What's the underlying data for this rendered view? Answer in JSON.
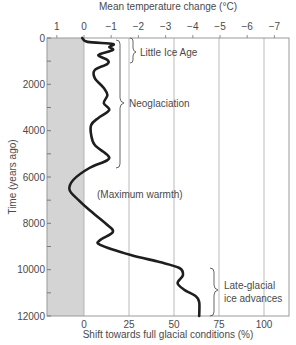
{
  "chart_data": {
    "type": "line",
    "title": "",
    "top_axis": {
      "label": "Mean temperature change (°C)",
      "ticks": [
        "1",
        "0",
        "−1",
        "−2",
        "−3",
        "−4",
        "−5",
        "−6",
        "−7"
      ],
      "tick_values": [
        1,
        0,
        -1,
        -2,
        -3,
        -4,
        -5,
        -6,
        -7
      ]
    },
    "xlabel": "Shift towards full glacial conditions (%)",
    "ylabel": "Time (years ago)",
    "x_ticks": [
      "0",
      "25",
      "50",
      "75",
      "100"
    ],
    "x_tick_values": [
      0,
      25,
      50,
      75,
      100
    ],
    "y_ticks": [
      "0",
      "2000",
      "4000",
      "6000",
      "8000",
      "10000",
      "12000"
    ],
    "y_tick_values": [
      0,
      2000,
      4000,
      6000,
      8000,
      10000,
      12000
    ],
    "xlim": [
      -20,
      113
    ],
    "ylim": [
      0,
      12000
    ],
    "y_inverted": true,
    "shaded_region": {
      "x_from": -20,
      "x_to": 0,
      "color": "#d4d4d4"
    },
    "grid": {
      "vertical_at": [
        0,
        25,
        50,
        75,
        100
      ],
      "horizontal": false
    },
    "series": [
      {
        "name": "Glacial conditions shift",
        "points": [
          {
            "time": 0,
            "pct": -1
          },
          {
            "time": 170,
            "pct": 2
          },
          {
            "time": 260,
            "pct": 16
          },
          {
            "time": 390,
            "pct": 14
          },
          {
            "time": 520,
            "pct": 16
          },
          {
            "time": 730,
            "pct": 8
          },
          {
            "time": 950,
            "pct": 13
          },
          {
            "time": 1120,
            "pct": 13
          },
          {
            "time": 1380,
            "pct": 6
          },
          {
            "time": 1730,
            "pct": 6
          },
          {
            "time": 2160,
            "pct": 11
          },
          {
            "time": 2460,
            "pct": 13
          },
          {
            "time": 2810,
            "pct": 11
          },
          {
            "time": 3110,
            "pct": 14
          },
          {
            "time": 3450,
            "pct": 8
          },
          {
            "time": 3750,
            "pct": 4
          },
          {
            "time": 4190,
            "pct": 4
          },
          {
            "time": 4620,
            "pct": 6
          },
          {
            "time": 5050,
            "pct": 13
          },
          {
            "time": 5270,
            "pct": 13
          },
          {
            "time": 5610,
            "pct": 3
          },
          {
            "time": 6130,
            "pct": -6
          },
          {
            "time": 6560,
            "pct": -8
          },
          {
            "time": 7000,
            "pct": -3
          },
          {
            "time": 7430,
            "pct": 3
          },
          {
            "time": 8070,
            "pct": 13
          },
          {
            "time": 8380,
            "pct": 16
          },
          {
            "time": 8720,
            "pct": 9
          },
          {
            "time": 8930,
            "pct": 9
          },
          {
            "time": 9370,
            "pct": 26
          },
          {
            "time": 9670,
            "pct": 42
          },
          {
            "time": 9930,
            "pct": 53
          },
          {
            "time": 10230,
            "pct": 55
          },
          {
            "time": 10580,
            "pct": 52
          },
          {
            "time": 10880,
            "pct": 56
          },
          {
            "time": 11140,
            "pct": 62
          },
          {
            "time": 11390,
            "pct": 64
          },
          {
            "time": 12000,
            "pct": 64
          }
        ]
      }
    ],
    "annotations": [
      {
        "text": "Little Ice Age",
        "bracket_time": [
          0,
          1100
        ]
      },
      {
        "text": "Neoglaciation",
        "bracket_time": [
          100,
          5600
        ]
      },
      {
        "text": "(Maximum warmth)",
        "at_time": 6650
      },
      {
        "text": "Late-glacial",
        "text2": "ice advances",
        "bracket_time": [
          9800,
          12000
        ]
      }
    ]
  },
  "labels": {
    "top_title": "Mean temperature change (°C)",
    "bottom_title": "Shift towards full glacial conditions (%)",
    "left_title": "Time (years ago)",
    "little_ice_age": "Little Ice Age",
    "neoglaciation": "Neoglaciation",
    "max_warmth": "(Maximum warmth)",
    "late_glacial_1": "Late-glacial",
    "late_glacial_2": "ice advances"
  }
}
